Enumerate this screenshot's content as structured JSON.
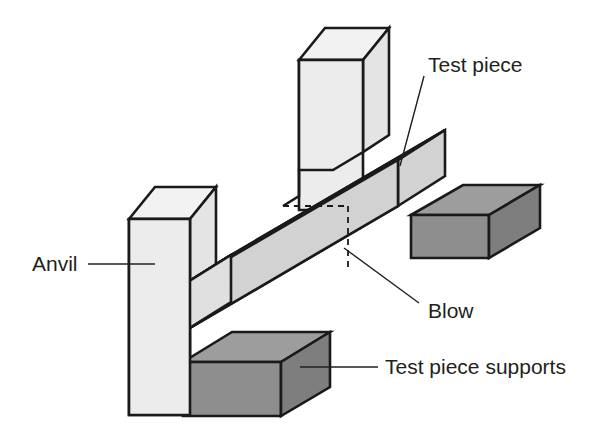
{
  "figure": {
    "kind": "technical-illustration",
    "background_color": "#ffffff",
    "line_color": "#1a1a1a"
  },
  "labels": {
    "test_piece": "Test piece",
    "anvil": "Anvil",
    "blow": "Blow",
    "test_piece_supports": "Test piece supports"
  },
  "palette": {
    "anvil_top": "#f2f2f2",
    "anvil_front": "#ececec",
    "anvil_side": "#e4e4e4",
    "beam_top": "#dcdcdc",
    "beam_front": "#d2d2d2",
    "beam_end": "#e0e0e0",
    "support_top": "#9d9d9d",
    "support_front": "#8e8e8e",
    "support_side": "#7e7e7e",
    "outline": "#1a1a1a",
    "text": "#231f20"
  },
  "parts": [
    {
      "id": "anvil-rear",
      "name": "Anvil (rear upright)",
      "role": "anvil",
      "shade": "light"
    },
    {
      "id": "anvil-front",
      "name": "Anvil (front upright)",
      "role": "anvil",
      "shade": "light"
    },
    {
      "id": "test-piece-beam",
      "name": "Test piece (notched bar)",
      "role": "specimen",
      "shade": "mid-light"
    },
    {
      "id": "support-rear",
      "name": "Test piece support (rear block)",
      "role": "support",
      "shade": "dark"
    },
    {
      "id": "support-front",
      "name": "Test piece support (front block)",
      "role": "support",
      "shade": "dark"
    },
    {
      "id": "notch-indicator",
      "name": "Notch / blow location (hidden edges)",
      "role": "annotation",
      "style": "dashed"
    }
  ],
  "callouts": [
    {
      "id": "callout-test-piece",
      "label": "Test piece",
      "text_anchor": "start",
      "text_x": 428,
      "text_y": 66
    },
    {
      "id": "callout-anvil",
      "label": "Anvil",
      "text_anchor": "start",
      "text_x": 32,
      "text_y": 265
    },
    {
      "id": "callout-blow",
      "label": "Blow",
      "text_anchor": "start",
      "text_x": 428,
      "text_y": 312
    },
    {
      "id": "callout-supports",
      "label": "Test piece supports",
      "text_anchor": "start",
      "text_x": 385,
      "text_y": 368
    }
  ]
}
